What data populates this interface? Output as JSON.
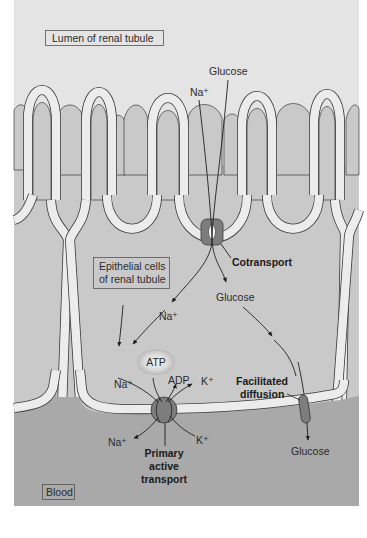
{
  "figure": {
    "regions": {
      "lumen": "Lumen of renal tubule",
      "epithelial_line1": "Epithelial cells",
      "epithelial_line2": "of renal tubule",
      "blood": "Blood"
    },
    "labels": {
      "glucose_top": "Glucose",
      "na_top": "Na⁺",
      "cotransport": "Cotransport",
      "glucose_mid": "Glucose",
      "na_mid": "Na⁺",
      "atp": "ATP",
      "adp": "ADP",
      "na_pump_in": "Na⁺",
      "k_pump_out": "K⁺",
      "na_pump_out": "Na⁺",
      "k_pump_in": "K⁺",
      "primary_line1": "Primary",
      "primary_line2": "active",
      "primary_line3": "transport",
      "facilitated_line1": "Facilitated",
      "facilitated_line2": "diffusion",
      "glucose_blood": "Glucose"
    },
    "colors": {
      "lumen_bg": "#e4e4e4",
      "cell_fill": "#c9c9c9",
      "membrane": "#ececec",
      "blood_bg": "#a9a9a9",
      "transporter": "#7d7d7d",
      "outline": "#3a3a3a"
    }
  }
}
